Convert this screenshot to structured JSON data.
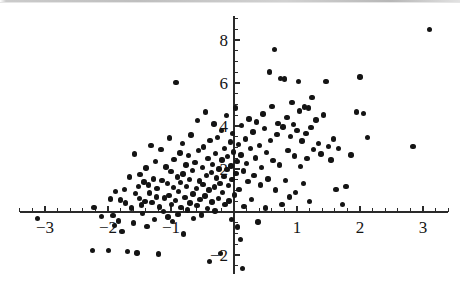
{
  "figure": {
    "background_color": "#ffffff",
    "ink_color": "#141414",
    "width": 460,
    "height": 289
  },
  "chart_data": {
    "type": "scatter",
    "title": "",
    "subtitle": "",
    "xlabel": "",
    "ylabel": "",
    "legend": [],
    "legend_position": "none",
    "grid": false,
    "marker": {
      "shape": "circle",
      "color": "#141414",
      "size_px": 5.4
    },
    "axes_style": "centered-cross",
    "origin_px": {
      "x": 234,
      "y": 212
    },
    "scale_px_per_unit": {
      "x": 63.0,
      "y": 21.5
    },
    "xlim": [
      -3.4,
      3.4
    ],
    "ylim": [
      -2.9,
      9.1
    ],
    "xticks": [
      -3,
      -2,
      -1,
      1,
      2,
      3
    ],
    "xtick_labels": [
      "-3",
      "-2",
      "-1",
      "1",
      "2",
      "3"
    ],
    "xticks_minor_step": 0.2,
    "yticks": [
      -2,
      2,
      4,
      6,
      8
    ],
    "ytick_labels": [
      "-2",
      "2",
      "4",
      "6",
      "8"
    ],
    "yticks_minor_step": 0.5,
    "n_points": 214,
    "points": [
      [
        -3.12,
        -0.3
      ],
      [
        -2.25,
        -1.78
      ],
      [
        -2.22,
        0.2
      ],
      [
        -2.1,
        -0.22
      ],
      [
        -1.99,
        -1.8
      ],
      [
        -1.96,
        0.6
      ],
      [
        -1.92,
        -0.16
      ],
      [
        -1.9,
        -0.62
      ],
      [
        -1.88,
        0.94
      ],
      [
        -1.83,
        -0.42
      ],
      [
        -1.8,
        0.55
      ],
      [
        -1.78,
        -0.9
      ],
      [
        -1.74,
        1.04
      ],
      [
        -1.72,
        0.42
      ],
      [
        -1.69,
        -1.85
      ],
      [
        -1.66,
        1.62
      ],
      [
        -1.63,
        0.18
      ],
      [
        -1.6,
        -0.52
      ],
      [
        -1.58,
        2.7
      ],
      [
        -1.56,
        0.86
      ],
      [
        -1.54,
        -1.9
      ],
      [
        -1.52,
        1.18
      ],
      [
        -1.5,
        0.62
      ],
      [
        -1.49,
        1.74
      ],
      [
        -1.47,
        0.32
      ],
      [
        -1.45,
        -0.08
      ],
      [
        -1.43,
        1.4
      ],
      [
        -1.41,
        0.5
      ],
      [
        -1.4,
        2.05
      ],
      [
        -1.38,
        -0.68
      ],
      [
        -1.36,
        1.26
      ],
      [
        -1.34,
        0.88
      ],
      [
        -1.32,
        3.1
      ],
      [
        -1.3,
        0.44
      ],
      [
        -1.28,
        1.54
      ],
      [
        -1.26,
        -0.34
      ],
      [
        -1.25,
        2.36
      ],
      [
        -1.23,
        0.7
      ],
      [
        -1.22,
        1.1
      ],
      [
        -1.2,
        -1.95
      ],
      [
        -1.18,
        0.24
      ],
      [
        -1.16,
        2.92
      ],
      [
        -1.14,
        1.46
      ],
      [
        -1.12,
        0.02
      ],
      [
        -1.1,
        0.66
      ],
      [
        -1.08,
        2.1
      ],
      [
        -1.06,
        1.32
      ],
      [
        -1.05,
        -0.24
      ],
      [
        -1.03,
        0.78
      ],
      [
        -1.02,
        3.44
      ],
      [
        -1.0,
        1.88
      ],
      [
        -0.99,
        0.36
      ],
      [
        -0.98,
        -0.44
      ],
      [
        -0.96,
        1.14
      ],
      [
        -0.95,
        2.44
      ],
      [
        -0.93,
        0.54
      ],
      [
        -0.92,
        6.02
      ],
      [
        -0.9,
        1.62
      ],
      [
        -0.89,
        -0.12
      ],
      [
        -0.88,
        0.96
      ],
      [
        -0.86,
        2.74
      ],
      [
        -0.85,
        1.36
      ],
      [
        -0.84,
        0.22
      ],
      [
        -0.82,
        3.2
      ],
      [
        -0.81,
        1.76
      ],
      [
        -0.8,
        -1.02
      ],
      [
        -0.78,
        0.68
      ],
      [
        -0.76,
        2.18
      ],
      [
        -0.75,
        1.2
      ],
      [
        -0.74,
        0.1
      ],
      [
        -0.72,
        2.62
      ],
      [
        -0.71,
        1.52
      ],
      [
        -0.7,
        0.42
      ],
      [
        -0.68,
        3.58
      ],
      [
        -0.66,
        1.94
      ],
      [
        -0.65,
        0.84
      ],
      [
        -0.64,
        -0.3
      ],
      [
        -0.62,
        2.3
      ],
      [
        -0.6,
        1.08
      ],
      [
        -0.59,
        0.3
      ],
      [
        -0.58,
        4.26
      ],
      [
        -0.56,
        2.86
      ],
      [
        -0.55,
        1.44
      ],
      [
        -0.54,
        0.58
      ],
      [
        -0.52,
        -0.14
      ],
      [
        -0.5,
        2.06
      ],
      [
        -0.49,
        1.28
      ],
      [
        -0.48,
        3.02
      ],
      [
        -0.46,
        0.74
      ],
      [
        -0.45,
        4.66
      ],
      [
        -0.44,
        1.7
      ],
      [
        -0.42,
        0.16
      ],
      [
        -0.41,
        2.5
      ],
      [
        -0.4,
        1.02
      ],
      [
        -0.39,
        -2.3
      ],
      [
        -0.38,
        3.34
      ],
      [
        -0.36,
        1.84
      ],
      [
        -0.35,
        0.46
      ],
      [
        -0.34,
        2.22
      ],
      [
        -0.32,
        4.1
      ],
      [
        -0.31,
        1.16
      ],
      [
        -0.3,
        0.04
      ],
      [
        -0.29,
        2.72
      ],
      [
        -0.28,
        1.58
      ],
      [
        -0.26,
        3.46
      ],
      [
        -0.25,
        0.64
      ],
      [
        -0.24,
        2.0
      ],
      [
        -0.22,
        1.34
      ],
      [
        -0.21,
        -1.92
      ],
      [
        -0.2,
        3.8
      ],
      [
        -0.19,
        2.42
      ],
      [
        -0.18,
        0.9
      ],
      [
        -0.16,
        1.66
      ],
      [
        -0.15,
        2.94
      ],
      [
        -0.14,
        0.34
      ],
      [
        -0.12,
        4.48
      ],
      [
        -0.11,
        1.98
      ],
      [
        -0.1,
        2.58
      ],
      [
        -0.09,
        1.22
      ],
      [
        -0.08,
        0.52
      ],
      [
        -0.06,
        3.26
      ],
      [
        -0.05,
        2.14
      ],
      [
        -0.04,
        -0.36
      ],
      [
        -0.03,
        1.5
      ],
      [
        -0.02,
        3.66
      ],
      [
        -0.01,
        2.8
      ],
      [
        0.01,
        0.8
      ],
      [
        0.02,
        4.84
      ],
      [
        0.03,
        1.78
      ],
      [
        0.05,
        2.34
      ],
      [
        0.06,
        -0.7
      ],
      [
        0.07,
        3.14
      ],
      [
        0.08,
        1.06
      ],
      [
        0.1,
        -1.28
      ],
      [
        0.11,
        2.66
      ],
      [
        0.12,
        4.02
      ],
      [
        0.13,
        -2.62
      ],
      [
        0.15,
        1.9
      ],
      [
        0.16,
        0.26
      ],
      [
        0.18,
        3.4
      ],
      [
        0.2,
        2.26
      ],
      [
        0.22,
        1.42
      ],
      [
        0.24,
        4.32
      ],
      [
        0.26,
        2.96
      ],
      [
        0.28,
        0.58
      ],
      [
        0.3,
        3.72
      ],
      [
        0.32,
        1.7
      ],
      [
        0.34,
        2.52
      ],
      [
        0.36,
        4.18
      ],
      [
        0.38,
        -0.46
      ],
      [
        0.4,
        3.08
      ],
      [
        0.42,
        1.26
      ],
      [
        0.44,
        2.08
      ],
      [
        0.46,
        4.56
      ],
      [
        0.48,
        3.88
      ],
      [
        0.5,
        0.18
      ],
      [
        0.52,
        2.78
      ],
      [
        0.54,
        1.54
      ],
      [
        0.56,
        6.52
      ],
      [
        0.58,
        3.34
      ],
      [
        0.6,
        4.92
      ],
      [
        0.62,
        2.4
      ],
      [
        0.64,
        7.56
      ],
      [
        0.66,
        1.02
      ],
      [
        0.68,
        3.6
      ],
      [
        0.7,
        4.12
      ],
      [
        0.72,
        2.18
      ],
      [
        0.74,
        6.22
      ],
      [
        0.76,
        0.34
      ],
      [
        0.78,
        3.96
      ],
      [
        0.8,
        6.18
      ],
      [
        0.82,
        1.46
      ],
      [
        0.84,
        4.4
      ],
      [
        0.86,
        2.86
      ],
      [
        0.88,
        0.7
      ],
      [
        0.9,
        3.52
      ],
      [
        0.92,
        5.1
      ],
      [
        0.94,
        4.06
      ],
      [
        0.96,
        2.6
      ],
      [
        0.98,
        0.92
      ],
      [
        1.0,
        3.8
      ],
      [
        1.02,
        6.08
      ],
      [
        1.04,
        4.7
      ],
      [
        1.06,
        2.12
      ],
      [
        1.08,
        3.3
      ],
      [
        1.1,
        1.32
      ],
      [
        1.12,
        4.88
      ],
      [
        1.14,
        3.64
      ],
      [
        1.16,
        2.48
      ],
      [
        1.18,
        4.84
      ],
      [
        1.2,
        0.5
      ],
      [
        1.22,
        3.94
      ],
      [
        1.24,
        5.34
      ],
      [
        1.26,
        2.9
      ],
      [
        1.3,
        4.28
      ],
      [
        1.34,
        3.18
      ],
      [
        1.38,
        2.7
      ],
      [
        1.42,
        4.52
      ],
      [
        1.46,
        6.06
      ],
      [
        1.5,
        3.06
      ],
      [
        1.54,
        2.42
      ],
      [
        1.58,
        3.4
      ],
      [
        1.62,
        1.04
      ],
      [
        1.66,
        2.96
      ],
      [
        1.72,
        0.36
      ],
      [
        1.78,
        1.18
      ],
      [
        1.86,
        2.66
      ],
      [
        1.94,
        4.66
      ],
      [
        2.0,
        6.28
      ],
      [
        2.06,
        4.58
      ],
      [
        2.12,
        3.46
      ],
      [
        2.84,
        3.06
      ],
      [
        3.1,
        8.5
      ]
    ]
  }
}
